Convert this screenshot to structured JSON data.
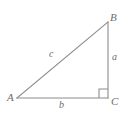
{
  "figure": {
    "type": "right-triangle-diagram",
    "background_color": "#ffffff",
    "stroke_color": "#8c8c8c",
    "label_color": "#6b6b6b",
    "vertices": [
      {
        "name": "A",
        "label": "A",
        "x": 17,
        "y": 98
      },
      {
        "name": "B",
        "label": "B",
        "x": 108,
        "y": 22
      },
      {
        "name": "C",
        "label": "C",
        "x": 108,
        "y": 98
      }
    ],
    "sides": [
      {
        "name": "hypotenuse",
        "label": "c",
        "from": "A",
        "to": "B"
      },
      {
        "name": "opposite",
        "label": "a",
        "from": "B",
        "to": "C"
      },
      {
        "name": "adjacent",
        "label": "b",
        "from": "A",
        "to": "C"
      }
    ],
    "right_angle": {
      "at_vertex": "C",
      "marker": "square",
      "size": 9
    }
  }
}
